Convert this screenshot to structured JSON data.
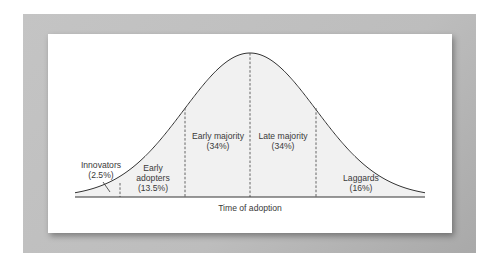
{
  "diagram": {
    "x_axis_label": "Time of adoption",
    "colors": {
      "frame": "#bdbdbd",
      "panel": "#ffffff",
      "curve": "#333333",
      "fill": "#f2f2f2",
      "divider": "#555555",
      "text": "#3a3a3a"
    },
    "segments": [
      {
        "name": "Innovators",
        "percent": "(2.5%)"
      },
      {
        "name_line1": "Early",
        "name_line2": "adopters",
        "percent": "(13.5%)"
      },
      {
        "name": "Early majority",
        "percent": "(34%)"
      },
      {
        "name": "Late majority",
        "percent": "(34%)"
      },
      {
        "name": "Laggards",
        "percent": "(16%)"
      }
    ]
  },
  "chart_data": {
    "type": "area",
    "title": "",
    "xlabel": "Time of adoption",
    "ylabel": "",
    "distribution": "normal",
    "categories": [
      "Innovators",
      "Early adopters",
      "Early majority",
      "Late majority",
      "Laggards"
    ],
    "values": [
      2.5,
      13.5,
      34,
      34,
      16
    ],
    "boundaries_in_sd": [
      -2,
      -1,
      0,
      1
    ],
    "grid": false,
    "legend": "none"
  }
}
